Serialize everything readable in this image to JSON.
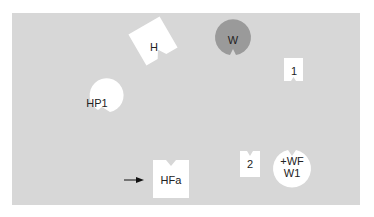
{
  "diagram": {
    "background_color": "#d7d7d7",
    "shapes": [
      {
        "id": "H",
        "label": "H",
        "type": "rotated-notched-square",
        "fill": "#ffffff"
      },
      {
        "id": "W",
        "label": "W",
        "type": "notched-circle",
        "fill": "#9a9a9a"
      },
      {
        "id": "1",
        "label": "1",
        "type": "notched-square",
        "fill": "#ffffff"
      },
      {
        "id": "HP1",
        "label": "HP1",
        "type": "notched-circle",
        "fill": "#ffffff"
      },
      {
        "id": "HFa",
        "label": "HFa",
        "type": "notched-square",
        "fill": "#ffffff",
        "pointer": "arrow-right"
      },
      {
        "id": "2",
        "label": "2",
        "type": "notched-square",
        "fill": "#ffffff"
      },
      {
        "id": "WF",
        "label_line1": "+WF",
        "label_line2": "W1",
        "type": "notched-circle",
        "fill": "#ffffff"
      }
    ]
  }
}
